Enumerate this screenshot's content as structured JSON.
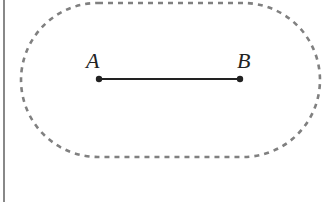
{
  "diagram": {
    "points": [
      {
        "label": "A",
        "x": 99,
        "y": 79
      },
      {
        "label": "B",
        "x": 240,
        "y": 79
      }
    ],
    "segment": {
      "from": "A",
      "to": "B"
    },
    "region": {
      "shape": "stadium",
      "style": "dashed",
      "color": "#808080"
    },
    "colors": {
      "segment": "#222222",
      "boundary": "#808080",
      "left_border": "#888888"
    }
  }
}
